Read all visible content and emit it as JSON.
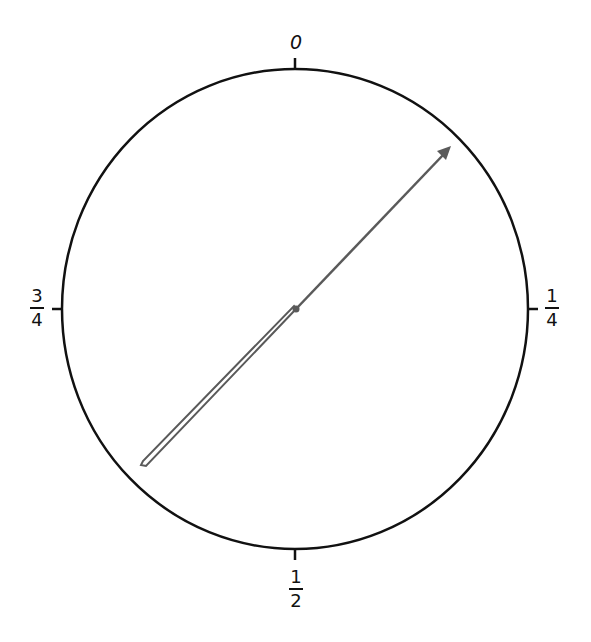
{
  "diagram": {
    "type": "spinner-dial",
    "labels": {
      "top": "0",
      "right": {
        "numerator": "1",
        "denominator": "4"
      },
      "bottom": {
        "numerator": "1",
        "denominator": "2"
      },
      "left": {
        "numerator": "3",
        "denominator": "4"
      }
    },
    "colors": {
      "circle": "#111111",
      "arrow": "#5a5a5a",
      "background": "#ffffff"
    }
  }
}
